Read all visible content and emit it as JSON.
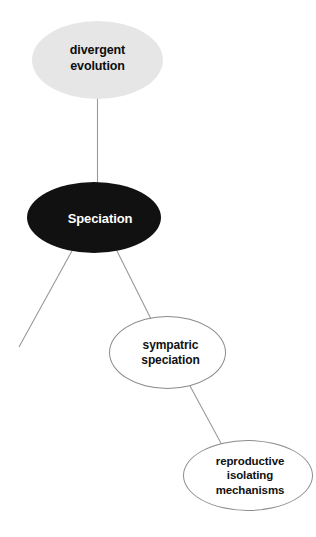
{
  "diagram": {
    "type": "concept-map",
    "background_color": "#ffffff",
    "nodes": [
      {
        "id": "divergent-evolution",
        "label": "divergent\nevolution",
        "shape": "ellipse",
        "fill": "#e6e6e6",
        "text_color": "#0d0d0d",
        "stroke": "none"
      },
      {
        "id": "speciation",
        "label": "Speciation",
        "shape": "ellipse",
        "fill": "#111111",
        "text_color": "#ffffff",
        "stroke": "none"
      },
      {
        "id": "sympatric-speciation",
        "label": "sympatric\nspeciation",
        "shape": "ellipse",
        "fill": "#ffffff",
        "text_color": "#111111",
        "stroke": "#8c8c8c"
      },
      {
        "id": "reproductive-isolating-mechanisms",
        "label": "reproductive\nisolating\nmechanisms",
        "shape": "ellipse",
        "fill": "#ffffff",
        "text_color": "#111111",
        "stroke": "#8c8c8c"
      }
    ],
    "edges": [
      {
        "id": "edge-divergent-evolution-speciation",
        "from": "divergent-evolution",
        "to": "speciation",
        "color": "#999999"
      },
      {
        "id": "edge-speciation-unlabeled-branch",
        "from": "speciation",
        "to": null,
        "color": "#999999"
      },
      {
        "id": "edge-speciation-sympatric-speciation",
        "from": "speciation",
        "to": "sympatric-speciation",
        "color": "#999999"
      },
      {
        "id": "edge-sympatric-speciation-reproductive-isolating-mechanisms",
        "from": "sympatric-speciation",
        "to": "reproductive-isolating-mechanisms",
        "color": "#999999"
      }
    ]
  }
}
